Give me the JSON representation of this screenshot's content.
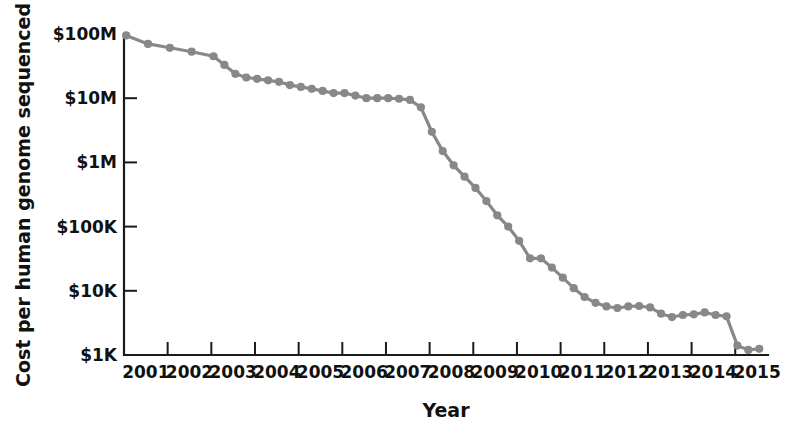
{
  "chart_data": {
    "type": "line",
    "title": "",
    "xlabel": "Year",
    "ylabel": "Cost per human genome sequenced",
    "yscale": "log",
    "ylim": [
      1000,
      100000000
    ],
    "xlim": [
      2001,
      2015.75
    ],
    "grid": false,
    "legend": null,
    "series_color": "#888888",
    "axis_color": "#1a1a1a",
    "background": "#ffffff",
    "ytick_labels": [
      "$100M",
      "$10M",
      "$1M",
      "$100K",
      "$10K",
      "$1K"
    ],
    "ytick_values": [
      100000000,
      10000000,
      1000000,
      100000,
      10000,
      1000
    ],
    "xtick_labels": [
      "2001",
      "2002",
      "2003",
      "2004",
      "2005",
      "2006",
      "2007",
      "2008",
      "2009",
      "2010",
      "2011",
      "2012",
      "2013",
      "2014",
      "2015"
    ],
    "xtick_values": [
      2001,
      2002,
      2003,
      2004,
      2005,
      2006,
      2007,
      2008,
      2009,
      2010,
      2011,
      2012,
      2013,
      2014,
      2015
    ],
    "series": [
      {
        "name": "Cost per human genome sequenced",
        "x": [
          2001.05,
          2001.55,
          2002.05,
          2002.55,
          2003.05,
          2003.3,
          2003.55,
          2003.8,
          2004.05,
          2004.3,
          2004.55,
          2004.8,
          2005.05,
          2005.3,
          2005.55,
          2005.8,
          2006.05,
          2006.3,
          2006.55,
          2006.8,
          2007.05,
          2007.3,
          2007.55,
          2007.8,
          2008.05,
          2008.3,
          2008.55,
          2008.8,
          2009.05,
          2009.3,
          2009.55,
          2009.8,
          2010.05,
          2010.3,
          2010.55,
          2010.8,
          2011.05,
          2011.3,
          2011.55,
          2011.8,
          2012.05,
          2012.3,
          2012.55,
          2012.8,
          2013.05,
          2013.3,
          2013.55,
          2013.8,
          2014.05,
          2014.3,
          2014.55,
          2014.8,
          2015.05,
          2015.3,
          2015.55
        ],
        "y": [
          95000000,
          70000000,
          61000000,
          53000000,
          45000000,
          33000000,
          24000000,
          21000000,
          20000000,
          19000000,
          18000000,
          16000000,
          15000000,
          14000000,
          13000000,
          12000000,
          12000000,
          11000000,
          10000000,
          10000000,
          10000000,
          9800000,
          9400000,
          7200000,
          3000000,
          1500000,
          900000,
          600000,
          400000,
          250000,
          150000,
          100000,
          60000,
          32000,
          32000,
          23000,
          16000,
          11000,
          8000,
          6500,
          5700,
          5400,
          5700,
          5800,
          5500,
          4400,
          3900,
          4200,
          4300,
          4600,
          4200,
          4000,
          1400,
          1200,
          1250
        ]
      }
    ]
  },
  "axis_labels": {
    "y_title": "Cost per human genome sequenced",
    "x_title": "Year"
  }
}
